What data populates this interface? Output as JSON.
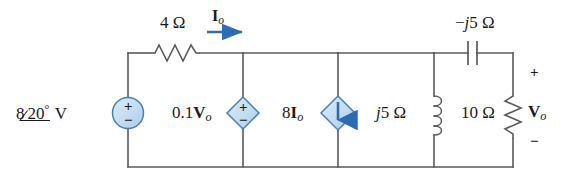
{
  "figure": {
    "type": "circuit-schematic",
    "wire_color": "#5a5a5a",
    "source_fill": "#c3dcf0",
    "source_stroke": "#4a7fb5",
    "arrow_color": "#2f6bb5",
    "text_color": "#1a1a1a"
  },
  "elements": {
    "source_ac": {
      "name": "independent-voltage-source",
      "label_value": "8",
      "label_angle": "20",
      "label_degree": "°",
      "label_unit": "V",
      "symbol": "circle",
      "plus": "+",
      "minus": "−"
    },
    "resistor_4ohm": {
      "name": "resistor-4-ohm",
      "label": "4 Ω",
      "orientation": "horizontal"
    },
    "current_io": {
      "name": "current-label-io",
      "label_main": "I",
      "label_sub": "o",
      "direction": "right"
    },
    "dep_vsource": {
      "name": "dependent-voltage-source",
      "label_coeff": "0.1",
      "label_main": "V",
      "label_sub": "o",
      "symbol": "diamond",
      "plus": "+",
      "minus": "−"
    },
    "dep_isource": {
      "name": "dependent-current-source",
      "label_coeff": "8",
      "label_main": "I",
      "label_sub": "o",
      "symbol": "diamond",
      "arrow": "down"
    },
    "inductor_j5": {
      "name": "inductor-j5-ohm",
      "label_j": "j",
      "label_rest": "5 Ω",
      "orientation": "vertical"
    },
    "capacitor_mj5": {
      "name": "capacitor-minus-j5-ohm",
      "label_sign": "−",
      "label_j": "j",
      "label_rest": "5 Ω",
      "orientation": "horizontal"
    },
    "resistor_10ohm": {
      "name": "resistor-10-ohm",
      "label": "10 Ω",
      "orientation": "vertical"
    },
    "voltage_vo": {
      "name": "output-voltage-vo",
      "label_main": "V",
      "label_sub": "o",
      "plus": "+",
      "minus": "−"
    }
  }
}
